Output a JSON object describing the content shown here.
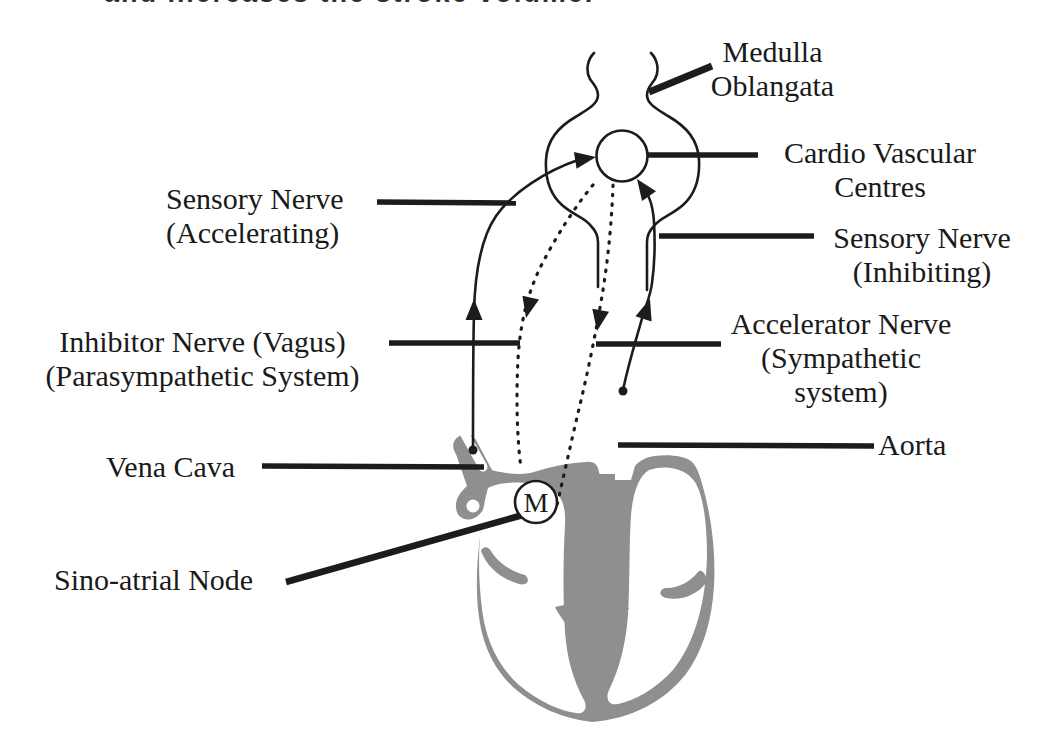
{
  "figure": {
    "top_clipped_line": "and increases the stroke volume.",
    "colors": {
      "ink": "#1c1c1c",
      "heart_gray": "#8f8f8f",
      "background": "#ffffff"
    },
    "labels": {
      "medulla": {
        "line1": "Medulla",
        "line2": "Oblangata"
      },
      "cardio_centres": {
        "line1": "Cardio Vascular",
        "line2": "Centres"
      },
      "sensory_accelerating": {
        "line1": "Sensory Nerve",
        "line2": "(Accelerating)"
      },
      "sensory_inhibiting": {
        "line1": "Sensory Nerve",
        "line2": "(Inhibiting)"
      },
      "inhibitor_nerve": {
        "line1": "Inhibitor Nerve (Vagus)",
        "line2": "(Parasympathetic System)"
      },
      "accelerator_nerve": {
        "line1": "Accelerator Nerve",
        "line2": "(Sympathetic",
        "line3": "system)"
      },
      "vena_cava": {
        "line1": "Vena Cava"
      },
      "aorta": {
        "line1": "Aorta"
      },
      "sino_atrial_node": {
        "line1": "Sino-atrial Node"
      },
      "sa_node_letter": "M"
    }
  }
}
